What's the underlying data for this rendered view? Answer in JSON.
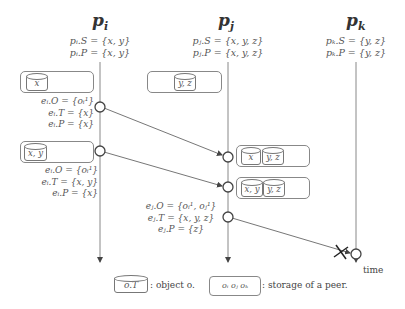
{
  "peers": [
    {
      "id": "i",
      "title": "p",
      "sub": "i",
      "S": "pᵢ.S = {x, y}",
      "P": "pᵢ.P = {x, y}"
    },
    {
      "id": "j",
      "title": "p",
      "sub": "j",
      "S": "pⱼ.S = {x, y, z}",
      "P": "pⱼ.P = {x, y, z}"
    },
    {
      "id": "k",
      "title": "p",
      "sub": "k",
      "S": "pₖ.S = {y, z}",
      "P": "pₖ.P = {y, z}"
    }
  ],
  "storages": {
    "pi_initial": [
      "x"
    ],
    "pj_initial": [
      "y, z"
    ],
    "pi_second": [
      "x, y"
    ],
    "pj_after_1": [
      "x",
      "y, z"
    ],
    "pj_after_2": [
      "x, y",
      "y, z"
    ]
  },
  "events": {
    "ei_1": {
      "O": "eᵢ.O = {oᵢ¹}",
      "T": "eᵢ.T = {x}",
      "P": "eᵢ.P = {x}"
    },
    "ei_2": {
      "O": "eᵢ.O = {oᵢ¹}",
      "T": "eᵢ.T = {x, y}",
      "P": "eᵢ.P = {x}"
    },
    "ej_1": {
      "O": "eⱼ.O = {oᵢ¹, oⱼ¹}",
      "T": "eⱼ.T = {x, y, z}",
      "P": "eⱼ.P = {z}"
    }
  },
  "legend": {
    "object_box": "o.T",
    "object_text": ": object o.",
    "storage_box": "oᵢ oⱼ oₖ",
    "storage_text": ": storage of a peer."
  },
  "time_label": "time",
  "colors": {
    "line": "#777",
    "text": "#555",
    "title": "#333"
  }
}
